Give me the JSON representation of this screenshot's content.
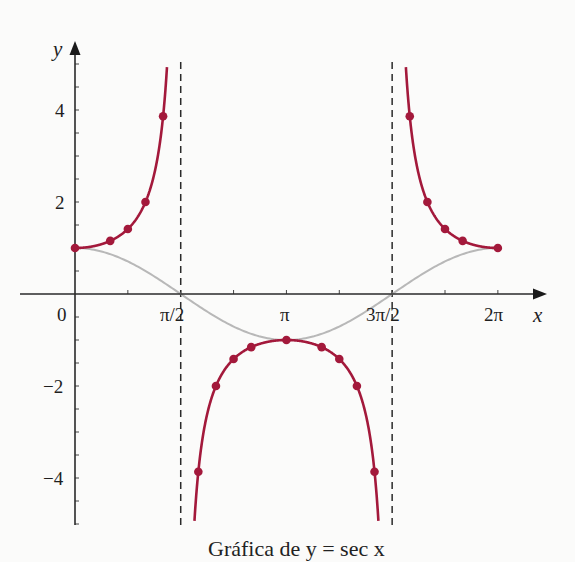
{
  "chart_data": {
    "type": "line",
    "title": "",
    "xlabel": "x",
    "ylabel": "y",
    "xlim": [
      -0.82,
      7.0
    ],
    "ylim": [
      -5,
      5.5
    ],
    "grid": false,
    "x_ticks": [
      {
        "value": 0,
        "label": "0"
      },
      {
        "value": 1.5708,
        "label": "π/2"
      },
      {
        "value": 3.1416,
        "label": "π"
      },
      {
        "value": 4.7124,
        "label": "3π/2"
      },
      {
        "value": 6.2832,
        "label": "2π"
      }
    ],
    "x_minor_ticks": [
      0.7854,
      2.3562,
      3.927,
      5.4978
    ],
    "y_ticks": [
      {
        "value": 4,
        "label": "4"
      },
      {
        "value": 2,
        "label": "2"
      },
      {
        "value": -2,
        "label": "−2"
      },
      {
        "value": -4,
        "label": "−4"
      }
    ],
    "y_minor_step": 0.5,
    "asymptotes": [
      1.5708,
      4.7124
    ],
    "series": [
      {
        "name": "y = sec x",
        "color": "#a3193b",
        "style": "solid",
        "markers": true,
        "points": [
          {
            "x": 0,
            "y": 1
          },
          {
            "x": 0.5236,
            "y": 1.155
          },
          {
            "x": 0.7854,
            "y": 1.414
          },
          {
            "x": 1.0472,
            "y": 2
          },
          {
            "x": 1.309,
            "y": 3.864
          },
          {
            "x": 1.8326,
            "y": -3.864
          },
          {
            "x": 2.0944,
            "y": -2
          },
          {
            "x": 2.3562,
            "y": -1.414
          },
          {
            "x": 2.618,
            "y": -1.155
          },
          {
            "x": 3.1416,
            "y": -1
          },
          {
            "x": 3.6652,
            "y": -1.155
          },
          {
            "x": 3.927,
            "y": -1.414
          },
          {
            "x": 4.1888,
            "y": -2
          },
          {
            "x": 4.4506,
            "y": -3.864
          },
          {
            "x": 4.9742,
            "y": 3.864
          },
          {
            "x": 5.236,
            "y": 2
          },
          {
            "x": 5.4978,
            "y": 1.414
          },
          {
            "x": 5.7596,
            "y": 1.155
          },
          {
            "x": 6.2832,
            "y": 1
          }
        ]
      },
      {
        "name": "y = cos x",
        "color": "#b8b8b8",
        "style": "solid",
        "markers": false,
        "domain": [
          0,
          6.2832
        ]
      }
    ],
    "caption": "Gráfica de y = sec x"
  },
  "labels": {
    "x_axis": "x",
    "y_axis": "y",
    "x_tick_0": "0",
    "x_tick_pi2": "π/2",
    "x_tick_pi": "π",
    "x_tick_3pi2": "3π/2",
    "x_tick_2pi": "2π",
    "y_tick_4": "4",
    "y_tick_2": "2",
    "y_tick_m2": "−2",
    "y_tick_m4": "−4",
    "caption": "Gráfica de y = sec x"
  }
}
